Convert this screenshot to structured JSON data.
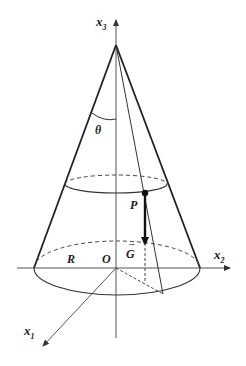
{
  "diagram": {
    "type": "cone-geometry",
    "labels": {
      "x3": "x",
      "x3_sub": "3",
      "x2": "x",
      "x2_sub": "2",
      "x1": "x",
      "x1_sub": "1",
      "theta": "θ",
      "P": "P",
      "G": "G",
      "G_arrow": "→",
      "R": "R",
      "O": "O"
    },
    "colors": {
      "stroke": "#222222",
      "axis": "#555555",
      "background": "#ffffff"
    }
  }
}
